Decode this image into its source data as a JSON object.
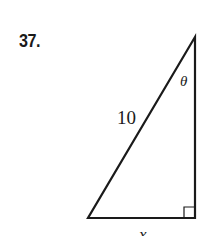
{
  "problem": {
    "number": "37."
  },
  "diagram": {
    "type": "right-triangle",
    "hypotenuse_label": "10",
    "angle_label": "θ",
    "base_label": "x",
    "right_angle_marker": true,
    "stroke_color": "#1a1a1a"
  }
}
